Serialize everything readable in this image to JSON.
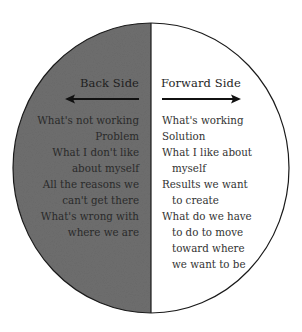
{
  "colors": {
    "back_fill": "#6e6e6e",
    "forward_fill": "#ffffff",
    "outline": "#1a1a1a",
    "text": "#222222"
  },
  "back_side": {
    "heading": "Back Side",
    "arrow_direction": "left",
    "items": [
      {
        "text": "What's not working"
      },
      {
        "text": "Problem"
      },
      {
        "text": "What I don't like"
      },
      {
        "text": "about myself"
      },
      {
        "text": "All the reasons we"
      },
      {
        "text": "can't get there"
      },
      {
        "text": "What's wrong with"
      },
      {
        "text": "where we are"
      }
    ]
  },
  "forward_side": {
    "heading": "Forward Side",
    "arrow_direction": "right",
    "items": [
      {
        "text": "What's working",
        "indent": false
      },
      {
        "text": "Solution",
        "indent": false
      },
      {
        "text": "What I like about",
        "indent": false
      },
      {
        "text": "myself",
        "indent": true
      },
      {
        "text": "Results we want",
        "indent": false
      },
      {
        "text": "to create",
        "indent": true
      },
      {
        "text": "What do we have",
        "indent": false
      },
      {
        "text": "to do to move",
        "indent": true
      },
      {
        "text": "toward where",
        "indent": true
      },
      {
        "text": "we want to be",
        "indent": true
      }
    ]
  }
}
